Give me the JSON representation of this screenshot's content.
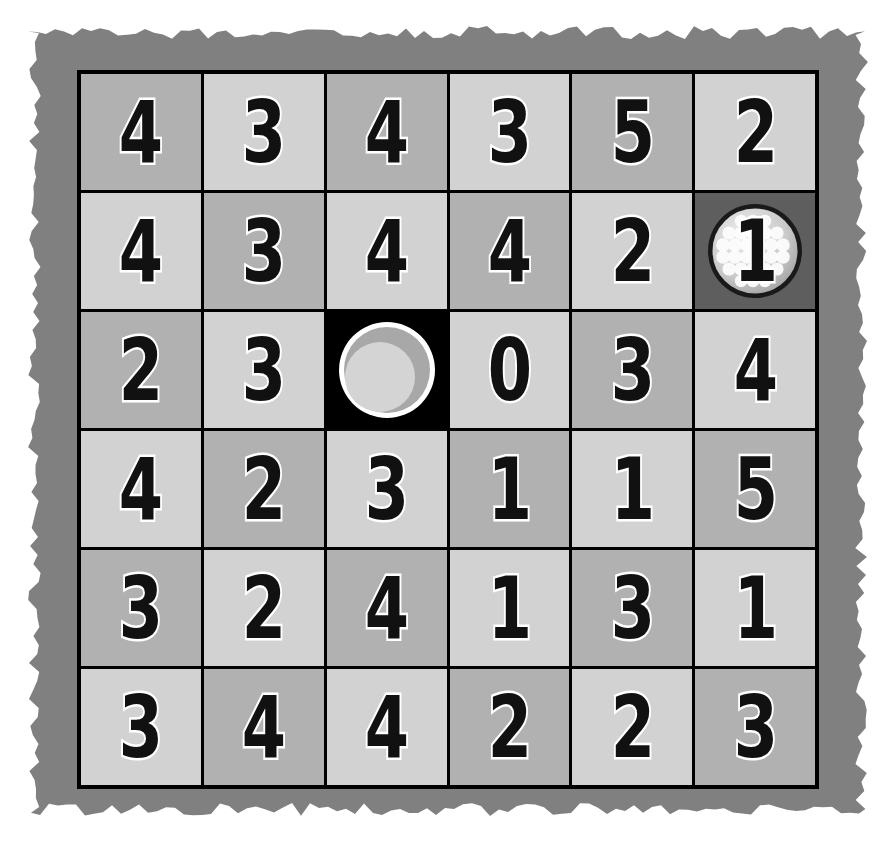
{
  "board": {
    "title": "Golf Number Grid",
    "rows": 6,
    "columns": 6,
    "background_color": "#ffffff",
    "mat_color": "#808080",
    "grid_line_color": "#000000",
    "cell_shade_dark": "#b1b1b1",
    "cell_shade_light": "#d2d2d2",
    "ball_cell_color": "#5e5e5e",
    "hole_cell_color": "#000000",
    "numeral_fill_color": "#111111",
    "numeral_outline_color": "#ffffff"
  },
  "markers": {
    "ball": {
      "icon": "golf-ball-icon",
      "row": 2,
      "col": 6,
      "value": "1"
    },
    "hole": {
      "icon": "golf-hole-icon",
      "row": 3,
      "col": 3,
      "value": ""
    }
  },
  "chart_data": {
    "type": "heatmap",
    "xlabel": "",
    "ylabel": "",
    "categories": [
      "C1",
      "C2",
      "C3",
      "C4",
      "C5",
      "C6"
    ],
    "row_labels": [
      "R1",
      "R2",
      "R3",
      "R4",
      "R5",
      "R6"
    ],
    "values": [
      [
        4,
        3,
        4,
        3,
        5,
        2
      ],
      [
        4,
        3,
        4,
        4,
        2,
        1
      ],
      [
        2,
        3,
        null,
        0,
        3,
        4
      ],
      [
        4,
        2,
        3,
        1,
        1,
        5
      ],
      [
        3,
        2,
        4,
        1,
        3,
        1
      ],
      [
        3,
        4,
        4,
        2,
        2,
        3
      ]
    ]
  },
  "cells": [
    [
      {
        "value": "4",
        "shade": "dark",
        "marker": ""
      },
      {
        "value": "3",
        "shade": "light",
        "marker": ""
      },
      {
        "value": "4",
        "shade": "dark",
        "marker": ""
      },
      {
        "value": "3",
        "shade": "light",
        "marker": ""
      },
      {
        "value": "5",
        "shade": "dark",
        "marker": ""
      },
      {
        "value": "2",
        "shade": "light",
        "marker": ""
      }
    ],
    [
      {
        "value": "4",
        "shade": "light",
        "marker": ""
      },
      {
        "value": "3",
        "shade": "dark",
        "marker": ""
      },
      {
        "value": "4",
        "shade": "light",
        "marker": ""
      },
      {
        "value": "4",
        "shade": "dark",
        "marker": ""
      },
      {
        "value": "2",
        "shade": "light",
        "marker": ""
      },
      {
        "value": "1",
        "shade": "ball",
        "marker": "ball"
      }
    ],
    [
      {
        "value": "2",
        "shade": "dark",
        "marker": ""
      },
      {
        "value": "3",
        "shade": "light",
        "marker": ""
      },
      {
        "value": "",
        "shade": "hole",
        "marker": "hole"
      },
      {
        "value": "0",
        "shade": "light",
        "marker": ""
      },
      {
        "value": "3",
        "shade": "dark",
        "marker": ""
      },
      {
        "value": "4",
        "shade": "light",
        "marker": ""
      }
    ],
    [
      {
        "value": "4",
        "shade": "light",
        "marker": ""
      },
      {
        "value": "2",
        "shade": "dark",
        "marker": ""
      },
      {
        "value": "3",
        "shade": "light",
        "marker": ""
      },
      {
        "value": "1",
        "shade": "dark",
        "marker": ""
      },
      {
        "value": "1",
        "shade": "light",
        "marker": ""
      },
      {
        "value": "5",
        "shade": "dark",
        "marker": ""
      }
    ],
    [
      {
        "value": "3",
        "shade": "dark",
        "marker": ""
      },
      {
        "value": "2",
        "shade": "light",
        "marker": ""
      },
      {
        "value": "4",
        "shade": "dark",
        "marker": ""
      },
      {
        "value": "1",
        "shade": "light",
        "marker": ""
      },
      {
        "value": "3",
        "shade": "dark",
        "marker": ""
      },
      {
        "value": "1",
        "shade": "light",
        "marker": ""
      }
    ],
    [
      {
        "value": "3",
        "shade": "light",
        "marker": ""
      },
      {
        "value": "4",
        "shade": "dark",
        "marker": ""
      },
      {
        "value": "4",
        "shade": "light",
        "marker": ""
      },
      {
        "value": "2",
        "shade": "dark",
        "marker": ""
      },
      {
        "value": "2",
        "shade": "light",
        "marker": ""
      },
      {
        "value": "3",
        "shade": "dark",
        "marker": ""
      }
    ]
  ]
}
